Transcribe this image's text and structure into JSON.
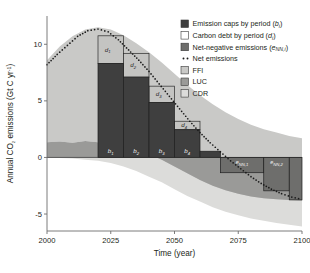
{
  "chart_data": {
    "type": "bar",
    "title": "",
    "xlabel": "Time (year)",
    "ylabel": "Annual CO2 emissions (Gt C yr-1)",
    "ylabel_parts": {
      "pre": "Annual CO",
      "sub": "2",
      "mid": " emissions (Gt C yr",
      "sup": "-1",
      "post": ")"
    },
    "xlim": [
      2000,
      2100
    ],
    "ylim": [
      -6.5,
      12.5
    ],
    "xticks": [
      "2000",
      "2025",
      "2050",
      "2075",
      "2100"
    ],
    "xtick_values": [
      2000,
      2025,
      2050,
      2075,
      2100
    ],
    "yticks": [
      "10",
      "5",
      "0",
      "-5"
    ],
    "ytick_values": [
      10,
      5,
      0,
      -5
    ],
    "grid": false,
    "legend_position": "top-right",
    "emission_caps": {
      "name": "Emission caps by period (b_i)",
      "periods": [
        {
          "label": "b1",
          "start": 2020,
          "end": 2030,
          "value": 8.3
        },
        {
          "label": "b2",
          "start": 2030,
          "end": 2040,
          "value": 7.1
        },
        {
          "label": "b3",
          "start": 2040,
          "end": 2050,
          "value": 4.85
        },
        {
          "label": "b4",
          "start": 2050,
          "end": 2060,
          "value": 2.45
        },
        {
          "label": "b5",
          "start": 2060,
          "end": 2068,
          "value": 0.55
        }
      ]
    },
    "carbon_debt": {
      "name": "Carbon debt by period (d_i)",
      "periods": [
        {
          "label": "d1",
          "start": 2020,
          "end": 2030,
          "top": 10.75,
          "bottom": 8.3
        },
        {
          "label": "d2",
          "start": 2030,
          "end": 2040,
          "top": 9.2,
          "bottom": 7.1
        },
        {
          "label": "d3",
          "start": 2040,
          "end": 2050,
          "top": 6.3,
          "bottom": 4.85
        },
        {
          "label": "d4",
          "start": 2050,
          "end": 2060,
          "top": 3.2,
          "bottom": 2.45
        }
      ]
    },
    "net_negative": {
      "name": "Net-negative emissions (e_NN,i)",
      "periods": [
        {
          "label": "eNN1",
          "start": 2068,
          "end": 2085,
          "value": -1.35
        },
        {
          "label": "eNN2",
          "start": 2085,
          "end": 2095,
          "value": -2.95
        },
        {
          "label": "eNN3",
          "start": 2095,
          "end": 2100,
          "value": -3.75
        }
      ]
    },
    "net_emissions": {
      "name": "Net emissions",
      "style": "dotted",
      "x": [
        2000,
        2004,
        2008,
        2012,
        2016,
        2020,
        2024,
        2028,
        2032,
        2036,
        2040,
        2044,
        2048,
        2052,
        2056,
        2060,
        2064,
        2068,
        2072,
        2076,
        2080,
        2084,
        2088,
        2092,
        2096,
        2100
      ],
      "y": [
        8.2,
        9.1,
        9.9,
        10.7,
        11.2,
        11.35,
        11.1,
        10.4,
        9.5,
        8.6,
        7.6,
        6.5,
        5.4,
        4.3,
        3.2,
        2.2,
        1.3,
        0.5,
        -0.3,
        -1.0,
        -1.7,
        -2.3,
        -2.8,
        -3.2,
        -3.5,
        -3.7
      ]
    },
    "bands": {
      "ffi": {
        "name": "FFI",
        "color": "#c9c9c7",
        "x": [
          2000,
          2005,
          2010,
          2015,
          2020,
          2025,
          2030,
          2035,
          2040,
          2045,
          2050,
          2055,
          2060,
          2065,
          2070,
          2075,
          2080,
          2085,
          2090,
          2095,
          2100
        ],
        "upper": [
          8.6,
          9.8,
          10.7,
          11.3,
          11.5,
          11.3,
          10.8,
          10.1,
          9.3,
          8.4,
          7.4,
          6.4,
          5.5,
          4.7,
          4.0,
          3.4,
          2.9,
          2.5,
          2.2,
          1.9,
          1.7
        ],
        "lower": [
          1.35,
          1.4,
          1.3,
          1.45,
          1.35,
          1.2,
          1.0,
          0.7,
          0.3,
          -0.2,
          -0.8,
          -1.4,
          -2.0,
          -2.5,
          -2.9,
          -3.2,
          -3.45,
          -3.6,
          -3.7,
          -3.75,
          -3.8
        ]
      },
      "luc": {
        "name": "LUC",
        "color": "#9a9a98",
        "x": [
          2000,
          2005,
          2010,
          2015,
          2020,
          2025,
          2030,
          2035,
          2040,
          2045,
          2050,
          2055,
          2060,
          2065,
          2070,
          2075,
          2080,
          2085,
          2090,
          2095,
          2100
        ],
        "upper": [
          1.35,
          1.4,
          1.3,
          1.45,
          1.35,
          1.2,
          1.0,
          0.7,
          0.3,
          -0.2,
          -0.8,
          -1.4,
          -2.0,
          -2.5,
          -2.9,
          -3.2,
          -3.45,
          -3.6,
          -3.7,
          -3.75,
          -3.8
        ],
        "lower": [
          0.0,
          0.0,
          0.0,
          0.0,
          0.0,
          0.0,
          0.0,
          0.0,
          0.0,
          0.0,
          0.0,
          0.0,
          0.0,
          0.0,
          0.0,
          0.0,
          0.0,
          0.0,
          0.0,
          0.0,
          0.0
        ]
      },
      "cdr": {
        "name": "CDR",
        "color": "#dcdcda",
        "x": [
          2000,
          2005,
          2010,
          2015,
          2020,
          2025,
          2030,
          2035,
          2040,
          2045,
          2050,
          2055,
          2060,
          2065,
          2070,
          2075,
          2080,
          2085,
          2090,
          2095,
          2100
        ],
        "upper": [
          0.0,
          0.0,
          0.0,
          0.0,
          0.0,
          0.0,
          0.0,
          0.0,
          0.0,
          0.0,
          0.0,
          0.0,
          0.0,
          0.0,
          0.0,
          0.0,
          0.0,
          0.0,
          0.0,
          0.0,
          0.0
        ],
        "lower": [
          0.0,
          -0.05,
          -0.1,
          -0.2,
          -0.3,
          -0.5,
          -0.8,
          -1.2,
          -1.7,
          -2.2,
          -2.8,
          -3.4,
          -3.9,
          -4.4,
          -4.8,
          -5.1,
          -5.4,
          -5.6,
          -5.8,
          -5.95,
          -6.1
        ]
      }
    },
    "colors": {
      "cap_fill": "#3f3f3f",
      "debt_fill": "#c4c4c2",
      "netneg_fill": "#6e6e6c",
      "ffi": "#c9c9c7",
      "luc": "#9a9a98",
      "cdr": "#dcdcda",
      "dots": "#1a1a1a",
      "axis": "#6d6d6d"
    },
    "legend": [
      {
        "key": "cap",
        "label_pre": "Emission caps by period (",
        "label_var": "b",
        "label_sub": "i",
        "label_post": ")",
        "swatch": "#3f3f3f",
        "type": "box"
      },
      {
        "key": "debt",
        "label_pre": "Carbon debt by period (",
        "label_var": "d",
        "label_sub": "i",
        "label_post": ")",
        "swatch": "#ffffff",
        "type": "box"
      },
      {
        "key": "netneg",
        "label_pre": "Net-negative emissions (",
        "label_var": "e",
        "label_sub": "NN,i",
        "label_post": ")",
        "swatch": "#6e6e6c",
        "type": "box"
      },
      {
        "key": "net",
        "label_pre": "Net emissions",
        "label_var": "",
        "label_sub": "",
        "label_post": "",
        "swatch": "#1a1a1a",
        "type": "dots"
      },
      {
        "key": "ffi",
        "label_pre": "FFI",
        "label_var": "",
        "label_sub": "",
        "label_post": "",
        "swatch": "#c9c9c7",
        "type": "box"
      },
      {
        "key": "luc",
        "label_pre": "LUC",
        "label_var": "",
        "label_sub": "",
        "label_post": "",
        "swatch": "#9a9a98",
        "type": "box"
      },
      {
        "key": "cdr",
        "label_pre": "CDR",
        "label_var": "",
        "label_sub": "",
        "label_post": "",
        "swatch": "#dcdcda",
        "type": "box"
      }
    ]
  }
}
